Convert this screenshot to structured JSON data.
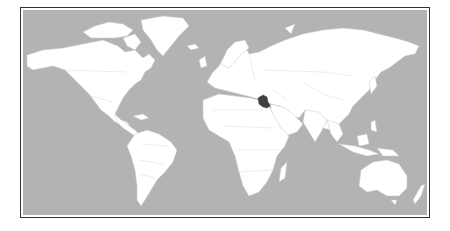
{
  "map": {
    "type": "world-locator-map",
    "highlighted_country": "Iraq",
    "colors": {
      "ocean": "#b3b3b3",
      "land": "#ffffff",
      "highlight": "#3f3f3f",
      "frame": "#333333"
    }
  }
}
